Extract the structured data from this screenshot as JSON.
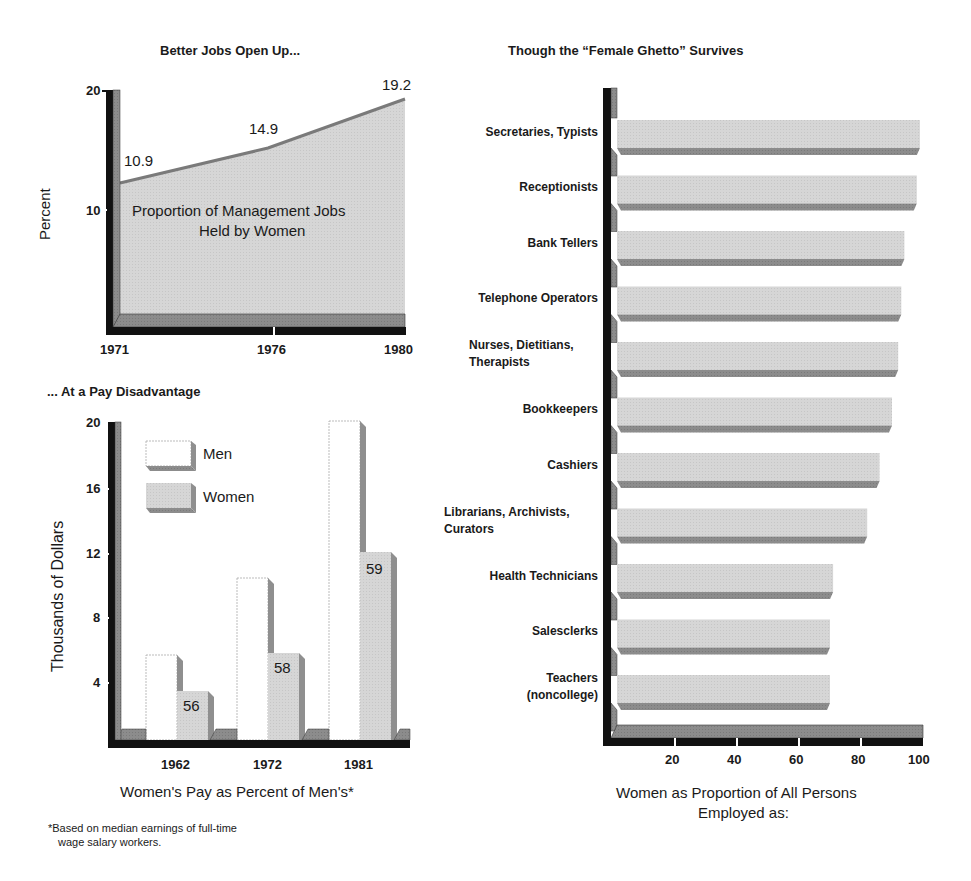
{
  "colors": {
    "axis_dark": "#111111",
    "axis_mid": "#8a8a8a",
    "area_fill": "#d6d6d6",
    "bar_light": "#d3d3d3",
    "bar_shadow": "#8f8f8f",
    "men_fill": "#ffffff",
    "line": "#7a7a7a"
  },
  "top_left": {
    "title": "Better Jobs Open Up...",
    "ylabel": "Percent",
    "yticks": [
      "20",
      "10"
    ],
    "xticks": [
      "1971",
      "1976",
      "1980"
    ],
    "point_labels": [
      "10.9",
      "14.9",
      "19.2"
    ],
    "area_label_1": "Proportion of Management Jobs",
    "area_label_2": "Held by Women"
  },
  "bottom_left": {
    "title": "... At a Pay Disadvantage",
    "ylabel": "Thousands of Dollars",
    "yticks": [
      "20",
      "16",
      "12",
      "8",
      "4"
    ],
    "xticks": [
      "1962",
      "1972",
      "1981"
    ],
    "legend": {
      "men": "Men",
      "women": "Women"
    },
    "pct_labels": [
      "56",
      "58",
      "59"
    ],
    "xlabel": "Women's Pay as Percent of Men's*",
    "footnote_1": "*Based on median earnings of full-time",
    "footnote_2": "wage salary workers."
  },
  "right": {
    "title": "Though the “Female Ghetto” Survives",
    "categories": [
      [
        "Secretaries, Typists"
      ],
      [
        "Receptionists"
      ],
      [
        "Bank Tellers"
      ],
      [
        "Telephone Operators"
      ],
      [
        "Nurses, Dietitians,",
        "Therapists"
      ],
      [
        "Bookkeepers"
      ],
      [
        "Cashiers"
      ],
      [
        "Librarians, Archivists,",
        "Curators"
      ],
      [
        "Health Technicians"
      ],
      [
        "Salesclerks"
      ],
      [
        "Teachers",
        "(noncollege)"
      ]
    ],
    "xticks": [
      "20",
      "40",
      "60",
      "80",
      "100"
    ],
    "xlabel_1": "Women as Proportion of All Persons",
    "xlabel_2": "Employed as:"
  },
  "chart_data": [
    {
      "type": "area",
      "title": "Better Jobs Open Up...",
      "xlabel": "",
      "ylabel": "Percent",
      "x": [
        1971,
        1976,
        1980
      ],
      "series": [
        {
          "name": "Proportion of Management Jobs Held by Women",
          "values": [
            10.9,
            14.9,
            19.2
          ]
        }
      ],
      "ylim": [
        0,
        20
      ],
      "yticks": [
        10,
        20
      ],
      "grid": false,
      "annotations": [
        "Proportion of Management Jobs Held by Women"
      ]
    },
    {
      "type": "bar",
      "title": "... At a Pay Disadvantage",
      "xlabel": "Women's Pay as Percent of Men's*",
      "ylabel": "Thousands of Dollars",
      "categories": [
        "1962",
        "1972",
        "1981"
      ],
      "series": [
        {
          "name": "Men",
          "values": [
            5.6,
            10.3,
            20.0
          ]
        },
        {
          "name": "Women",
          "values": [
            3.3,
            5.7,
            11.9
          ]
        }
      ],
      "data_labels": {
        "Women": [
          56,
          58,
          59
        ]
      },
      "ylim": [
        0,
        20
      ],
      "yticks": [
        4,
        8,
        12,
        16,
        20
      ],
      "legend_position": "upper-left",
      "footnote": "*Based on median earnings of full-time wage salary workers."
    },
    {
      "type": "bar",
      "orientation": "horizontal",
      "title": "Though the “Female Ghetto” Survives",
      "xlabel": "Women as Proportion of All Persons Employed as:",
      "ylabel": "",
      "categories": [
        "Secretaries, Typists",
        "Receptionists",
        "Bank Tellers",
        "Telephone Operators",
        "Nurses, Dietitians, Therapists",
        "Bookkeepers",
        "Cashiers",
        "Librarians, Archivists, Curators",
        "Health Technicians",
        "Salesclerks",
        "Teachers (noncollege)"
      ],
      "values": [
        99,
        98,
        94,
        93,
        92,
        90,
        86,
        82,
        71,
        70,
        70
      ],
      "xlim": [
        0,
        100
      ],
      "xticks": [
        20,
        40,
        60,
        80,
        100
      ],
      "grid": false
    }
  ]
}
